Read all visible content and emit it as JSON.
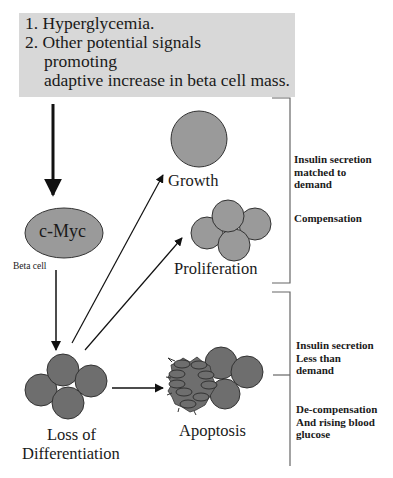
{
  "top_box": {
    "lines": [
      "1. Hyperglycemia.",
      "2. Other potential signals",
      "promoting",
      "adaptive increase in beta cell mass."
    ]
  },
  "nodes": {
    "cmyc": "c-Myc",
    "beta_cell": "Beta cell",
    "growth": "Growth",
    "proliferation": "Proliferation",
    "loss_line1": "Loss of",
    "loss_line2": "Differentiation",
    "apoptosis": "Apoptosis"
  },
  "right_panel": {
    "upper": {
      "line1": "Insulin secretion",
      "line2": "matched to",
      "line3": "demand",
      "state": "Compensation"
    },
    "lower": {
      "line1": "Insulin secretion",
      "line2": "Less than",
      "line3": "demand",
      "state1": "De-compensation",
      "state2": "And rising blood",
      "state3": "glucose"
    }
  },
  "colors": {
    "box_bg": "#d8d8d8",
    "cell_light": "#9a9a9a",
    "cell_dark": "#6e6e6e",
    "stroke": "#222222"
  }
}
